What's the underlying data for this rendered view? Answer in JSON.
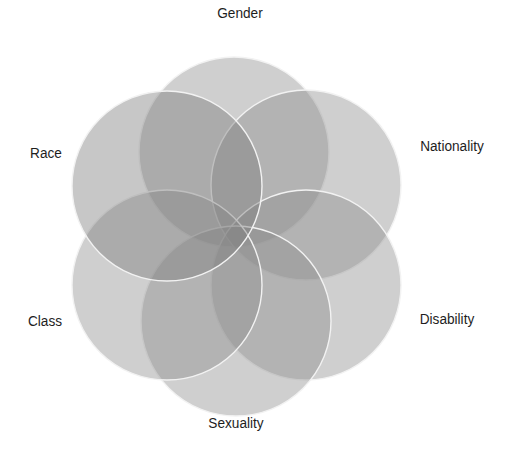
{
  "diagram": {
    "type": "overlapping-circles",
    "colors": {
      "background": "#ffffff",
      "circle_fill": "#8c8c8c",
      "race_fill": "#7a7a7a",
      "outline": "#f2f2f2",
      "label_text": "#1e1e1e"
    },
    "circles": [
      {
        "id": "gender",
        "label": "Gender",
        "cx": 234,
        "cy": 152,
        "r": 95,
        "label_x": 240,
        "label_y": 18
      },
      {
        "id": "nationality",
        "label": "Nationality",
        "cx": 306,
        "cy": 185,
        "r": 95,
        "label_x": 452,
        "label_y": 151
      },
      {
        "id": "disability",
        "label": "Disability",
        "cx": 306,
        "cy": 285,
        "r": 95,
        "label_x": 447,
        "label_y": 324
      },
      {
        "id": "sexuality",
        "label": "Sexuality",
        "cx": 236,
        "cy": 321,
        "r": 95,
        "label_x": 236,
        "label_y": 428
      },
      {
        "id": "class",
        "label": "Class",
        "cx": 167,
        "cy": 285,
        "r": 95,
        "label_x": 45,
        "label_y": 326
      },
      {
        "id": "race",
        "label": "Race",
        "cx": 167,
        "cy": 186,
        "r": 95,
        "label_x": 46,
        "label_y": 158
      }
    ]
  }
}
